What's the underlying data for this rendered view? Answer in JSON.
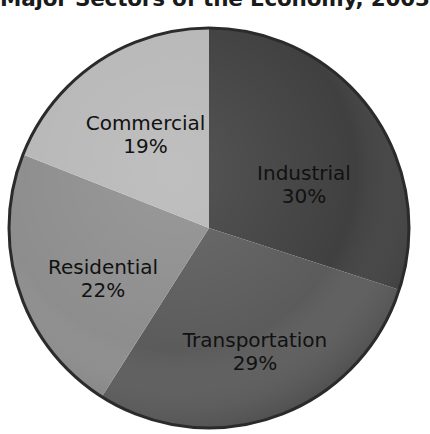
{
  "chart_data": {
    "type": "pie",
    "title": "Major Sectors of the Economy, 2003",
    "xlabel": "",
    "ylabel": "",
    "legend": "none",
    "grid": false,
    "units": "percent",
    "start_angle_deg": 0,
    "direction": "clockwise",
    "categories": [
      "Industrial",
      "Transportation",
      "Residential",
      "Commercial"
    ],
    "values": [
      30,
      29,
      22,
      19
    ],
    "total": 100,
    "slices": [
      {
        "label": "Industrial",
        "value": 30,
        "value_text": "30%",
        "color": "#3c3c3c"
      },
      {
        "label": "Transportation",
        "value": 29,
        "value_text": "29%",
        "color": "#585858"
      },
      {
        "label": "Residential",
        "value": 22,
        "value_text": "22%",
        "color": "#8b8b8b"
      },
      {
        "label": "Commercial",
        "value": 19,
        "value_text": "19%",
        "color": "#b6b6b6"
      }
    ]
  },
  "colors": {
    "background": "#ffffff",
    "title_text": "#1a1a1a",
    "label_text": "#111111",
    "slice_outline": "#2b2b2b"
  }
}
